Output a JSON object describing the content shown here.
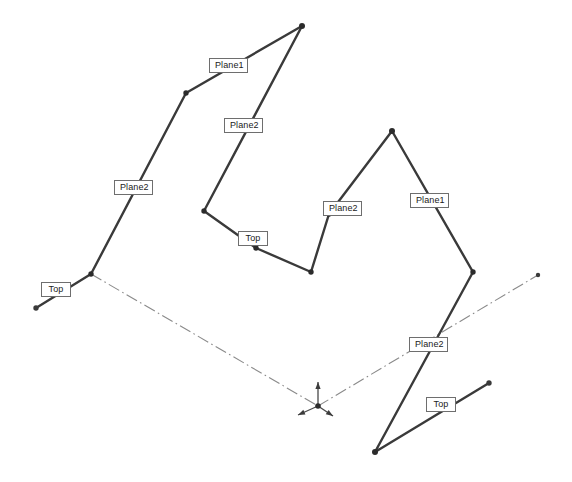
{
  "view": {
    "title": "Sketch Geometry View",
    "width": 572,
    "height": 482,
    "background_color": "#ffffff",
    "edge_color": "#3a3a3a",
    "centerline_color": "#8a8a8a",
    "label_border_color": "#6e6e6e",
    "label_text_color": "#1a1a1a"
  },
  "labels": [
    {
      "id": "label-plane1-upper-left",
      "text": "Plane1",
      "x": 209,
      "y": 58,
      "w": 39,
      "h": 15
    },
    {
      "id": "label-plane2-upper-mid",
      "text": "Plane2",
      "x": 224,
      "y": 118,
      "w": 39,
      "h": 15
    },
    {
      "id": "label-plane2-left",
      "text": "Plane2",
      "x": 114,
      "y": 180,
      "w": 39,
      "h": 15
    },
    {
      "id": "label-top-left",
      "text": "Top",
      "x": 41,
      "y": 282,
      "w": 30,
      "h": 15
    },
    {
      "id": "label-top-center",
      "text": "Top",
      "x": 238,
      "y": 231,
      "w": 30,
      "h": 15
    },
    {
      "id": "label-plane2-center",
      "text": "Plane2",
      "x": 323,
      "y": 201,
      "w": 39,
      "h": 15
    },
    {
      "id": "label-plane1-right",
      "text": "Plane1",
      "x": 410,
      "y": 193,
      "w": 39,
      "h": 15
    },
    {
      "id": "label-plane2-lower-right",
      "text": "Plane2",
      "x": 409,
      "y": 337,
      "w": 39,
      "h": 15
    },
    {
      "id": "label-top-bottom-right",
      "text": "Top",
      "x": 426,
      "y": 397,
      "w": 30,
      "h": 15
    }
  ],
  "geometry": {
    "solid_polylines": [
      {
        "id": "left-chain",
        "name": "left-sketch-chain",
        "points": "36,308 91,274 186,93 302,26"
      },
      {
        "id": "mid-chain",
        "name": "middle-sketch-chain",
        "points": "302,26 204,211 256,248 311,272"
      },
      {
        "id": "right-chain",
        "name": "right-sketch-chain",
        "points": "311,272 329,214 392,131 473,272"
      },
      {
        "id": "lower-right-chain",
        "name": "lower-right-sketch-chain",
        "points": "473,272 375,452 489,383"
      }
    ],
    "center_lines": [
      {
        "id": "centerline-left",
        "name": "construction-centerline-left",
        "points": "91,274 318,406"
      },
      {
        "id": "centerline-right",
        "name": "construction-centerline-right",
        "points": "318,406 538,275"
      }
    ],
    "vertices": [
      {
        "id": "v-left-end",
        "x": 36,
        "y": 308,
        "r": 2.7,
        "kind": "endpoint"
      },
      {
        "id": "v-left-node",
        "x": 91,
        "y": 274,
        "r": 2.7,
        "kind": "vertex"
      },
      {
        "id": "v-left-bend",
        "x": 186,
        "y": 93,
        "r": 2.7,
        "kind": "vertex"
      },
      {
        "id": "v-apex",
        "x": 302,
        "y": 26,
        "r": 3.0,
        "kind": "vertex"
      },
      {
        "id": "v-mid-bend",
        "x": 204,
        "y": 211,
        "r": 2.7,
        "kind": "vertex"
      },
      {
        "id": "v-mid-node",
        "x": 256,
        "y": 248,
        "r": 2.7,
        "kind": "vertex"
      },
      {
        "id": "v-valley",
        "x": 311,
        "y": 272,
        "r": 2.7,
        "kind": "vertex"
      },
      {
        "id": "v-right-bend",
        "x": 329,
        "y": 214,
        "r": 2.7,
        "kind": "vertex"
      },
      {
        "id": "v-right-peak",
        "x": 392,
        "y": 131,
        "r": 3.0,
        "kind": "vertex"
      },
      {
        "id": "v-right-node",
        "x": 473,
        "y": 272,
        "r": 2.7,
        "kind": "vertex"
      },
      {
        "id": "v-bottom-node",
        "x": 375,
        "y": 452,
        "r": 3.0,
        "kind": "vertex"
      },
      {
        "id": "v-bottom-right-end",
        "x": 489,
        "y": 383,
        "r": 2.7,
        "kind": "endpoint"
      },
      {
        "id": "v-centerline-end",
        "x": 538,
        "y": 275,
        "r": 2.2,
        "kind": "endpoint"
      }
    ],
    "origin_marker": {
      "id": "origin-triad",
      "x": 318,
      "y": 406,
      "axes": [
        {
          "id": "axis-up",
          "dx": 0,
          "dy": -24
        },
        {
          "id": "axis-left",
          "dx": -20,
          "dy": 9
        },
        {
          "id": "axis-right",
          "dx": 15,
          "dy": 10
        }
      ]
    }
  }
}
